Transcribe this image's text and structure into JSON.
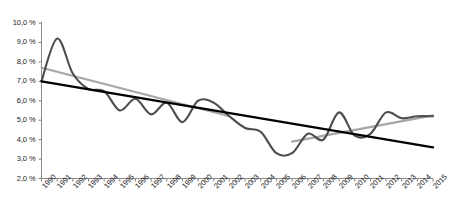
{
  "chart_data": {
    "type": "line",
    "title": "",
    "subtitle": "",
    "xlabel": "",
    "ylabel": "",
    "ylim": [
      2.0,
      10.0
    ],
    "ytick_step": 1.0,
    "ytick_labels": [
      "10,0 %",
      "9,0 %",
      "8,0 %",
      "7,0 %",
      "6,0 %",
      "5,0 %",
      "4,0 %",
      "3,0 %",
      "2,0 %"
    ],
    "ytick_values": [
      10.0,
      9.0,
      8.0,
      7.0,
      6.0,
      5.0,
      4.0,
      3.0,
      2.0
    ],
    "grid": false,
    "legend": "none",
    "categories": [
      "1990",
      "1991",
      "1992",
      "1993",
      "1994",
      "1995",
      "1996",
      "1997",
      "1998",
      "1999",
      "2000",
      "2001",
      "2002",
      "2003",
      "2004",
      "2005",
      "2006",
      "2007",
      "2008",
      "2009",
      "2010",
      "2011",
      "2012",
      "2013",
      "2014",
      "2015"
    ],
    "series": [
      {
        "name": "data-series",
        "color": "#4d4d4d",
        "style": "solid",
        "values": [
          7.0,
          9.2,
          7.4,
          6.6,
          6.5,
          5.5,
          6.1,
          5.3,
          5.9,
          4.9,
          6.0,
          5.9,
          5.2,
          4.6,
          4.4,
          3.3,
          3.3,
          4.3,
          4.0,
          5.4,
          4.2,
          4.3,
          5.4,
          5.1,
          5.2,
          5.2
        ]
      },
      {
        "name": "black-trend-line",
        "color": "#000000",
        "style": "trend-linear",
        "x_start": "1990",
        "x_end": "2015",
        "y_start": 7.0,
        "y_end": 3.6
      },
      {
        "name": "gray-trend-line-early",
        "color": "#a6a6a6",
        "style": "trend-linear",
        "x_start": "1990",
        "x_end": "2002",
        "y_start": 7.7,
        "y_end": 5.2
      },
      {
        "name": "gray-trend-line-late",
        "color": "#a6a6a6",
        "style": "trend-linear",
        "x_start": "2006",
        "x_end": "2015",
        "y_start": 3.9,
        "y_end": 5.25
      }
    ]
  },
  "axes": {
    "axis_color": "#808080",
    "tick_color": "#808080"
  }
}
